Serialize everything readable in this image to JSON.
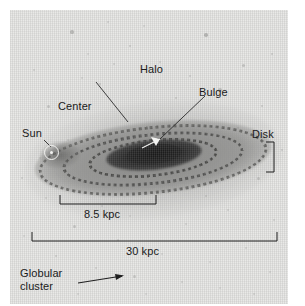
{
  "figure": {
    "type": "astronomy-diagram",
    "background_color": "#ffffff",
    "plate_color": "#e9e9e7",
    "ink_color": "#1a1a1a"
  },
  "labels": {
    "halo": "Halo",
    "center": "Center",
    "bulge": "Bulge",
    "sun": "Sun",
    "disk": "Disk",
    "globular_cluster_line1": "Globular",
    "globular_cluster_line2": "cluster"
  },
  "scale_bars": [
    {
      "id": "inner-scale",
      "label": "8.5 kpc",
      "value": 8.5,
      "unit": "kpc",
      "description": "distance from the Sun to the galactic center"
    },
    {
      "id": "outer-scale",
      "label": "30 kpc",
      "value": 30,
      "unit": "kpc",
      "description": "full diameter of the galactic disk"
    }
  ],
  "markers": {
    "sun_symbol": "circled-dot",
    "bulge_pointer": "arrowhead",
    "globular_pointer": "arrow"
  },
  "chart_data": {
    "type": "diagram",
    "components": [
      {
        "name": "Halo",
        "position": "upper diffuse region surrounding the galaxy"
      },
      {
        "name": "Center",
        "position": "galactic nucleus"
      },
      {
        "name": "Bulge",
        "position": "dense central ellipsoid"
      },
      {
        "name": "Sun",
        "position": "left side of the disk, 8.5 kpc from center"
      },
      {
        "name": "Disk",
        "position": "right outer edge of the flattened plane"
      },
      {
        "name": "Globular cluster",
        "position": "isolated point below the disk in the halo"
      }
    ],
    "measurements": [
      {
        "label": "8.5 kpc",
        "value": 8.5,
        "unit": "kpc"
      },
      {
        "label": "30 kpc",
        "value": 30,
        "unit": "kpc"
      }
    ]
  }
}
